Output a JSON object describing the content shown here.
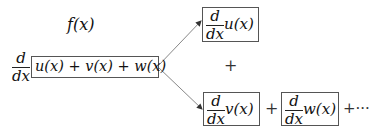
{
  "label_top": "f(x)",
  "main": {
    "operator_num": "d",
    "operator_den": "dx",
    "expression": "u(x) + v(x) + w(x)"
  },
  "branches": {
    "top": {
      "num": "d",
      "den": "dx",
      "fn": "u(x)"
    },
    "middle_plus": "+",
    "bottom_v": {
      "num": "d",
      "den": "dx",
      "fn": "v(x)"
    },
    "between_plus": "+",
    "bottom_w": {
      "num": "d",
      "den": "dx",
      "fn": "w(x)"
    },
    "trailing": "+···"
  },
  "colors": {
    "line": "#888888",
    "box_border": "#555555",
    "text": "#111111"
  }
}
